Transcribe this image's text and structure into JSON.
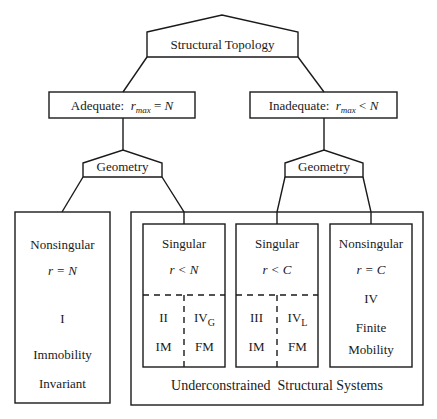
{
  "root": {
    "label": "Structural Topology"
  },
  "branches": [
    {
      "id": "adequate",
      "label": "Adequate:",
      "condition": {
        "var": "r",
        "sub": "max",
        "op": "=",
        "rhs": "N"
      },
      "geometry_label": "Geometry"
    },
    {
      "id": "inadequate",
      "label": "Inadequate:",
      "condition": {
        "var": "r",
        "sub": "max",
        "op": "<",
        "rhs": "N"
      },
      "geometry_label": "Geometry"
    }
  ],
  "leaves": {
    "nonsingular_adequate": {
      "title": "Nonsingular",
      "condition": "r = N",
      "class": "I",
      "line1": "Immobility",
      "line2": "Invariant"
    },
    "singular_adequate": {
      "title": "Singular",
      "condition": "r < N",
      "left": {
        "class": "II",
        "type": "IM"
      },
      "right": {
        "class": "IV",
        "class_sub": "G",
        "type": "FM"
      }
    },
    "singular_inadequate": {
      "title": "Singular",
      "condition": "r < C",
      "left": {
        "class": "III",
        "type": "IM"
      },
      "right": {
        "class": "IV",
        "class_sub": "L",
        "type": "FM"
      }
    },
    "nonsingular_inadequate": {
      "title": "Nonsingular",
      "condition": "r = C",
      "class": "IV",
      "line1": "Finite",
      "line2": "Mobility"
    }
  },
  "group": {
    "label": "Underconstrained  Structural Systems"
  }
}
